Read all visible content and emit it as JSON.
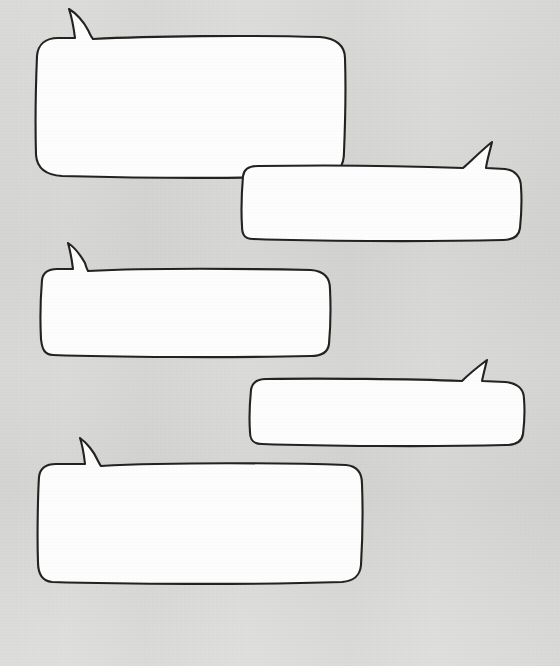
{
  "canvas": {
    "width": 560,
    "height": 666,
    "background_color": "#d7d7d5",
    "media": "scanned paper"
  },
  "style": {
    "ink_color": "#23201f",
    "fill_color": "#fdfdfd",
    "stroke_width": 2.1,
    "drawing_style": "hand-drawn"
  },
  "artboard": {
    "title": "Blank speech balloons",
    "description": "Five empty hand-drawn rounded speech bubbles on gray paper"
  },
  "bubbles": [
    {
      "id": "bubble-1",
      "order": 1,
      "text": "",
      "tail_direction": "up-left",
      "tail_apex": {
        "x": 69,
        "y": 8
      },
      "box": {
        "x": 36,
        "y": 37,
        "width": 309,
        "height": 139
      }
    },
    {
      "id": "bubble-2",
      "order": 2,
      "text": "",
      "tail_direction": "up-right",
      "tail_apex": {
        "x": 492,
        "y": 141
      },
      "box": {
        "x": 242,
        "y": 166,
        "width": 279,
        "height": 73
      }
    },
    {
      "id": "bubble-3",
      "order": 3,
      "text": "",
      "tail_direction": "up-left",
      "tail_apex": {
        "x": 68,
        "y": 242
      },
      "box": {
        "x": 42,
        "y": 268,
        "width": 288,
        "height": 87
      }
    },
    {
      "id": "bubble-4",
      "order": 4,
      "text": "",
      "tail_direction": "up-right",
      "tail_apex": {
        "x": 487,
        "y": 360
      },
      "box": {
        "x": 250,
        "y": 378,
        "width": 275,
        "height": 66
      }
    },
    {
      "id": "bubble-5",
      "order": 5,
      "text": "",
      "tail_direction": "up-left",
      "tail_apex": {
        "x": 80,
        "y": 437
      },
      "box": {
        "x": 38,
        "y": 462,
        "width": 324,
        "height": 120
      }
    }
  ],
  "caption": {
    "visible": true,
    "text": "",
    "note": "faint cut-off handwriting at bottom edge"
  }
}
